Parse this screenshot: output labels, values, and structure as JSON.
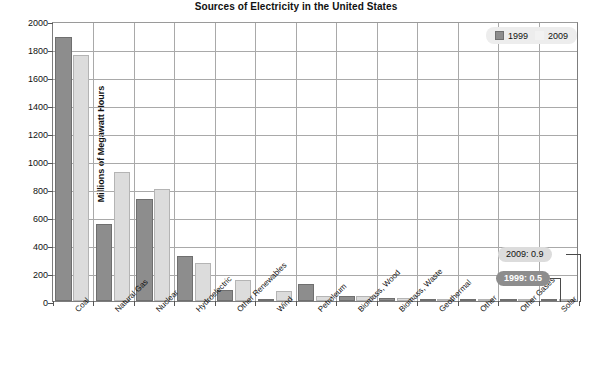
{
  "chart_data": {
    "type": "bar",
    "title": "Sources of Electricity in the United States",
    "xlabel": "",
    "ylabel": "Millions of Megawatt Hours",
    "ylim": [
      0,
      2000
    ],
    "ytick_step": 200,
    "yticks": [
      "2000",
      "1800",
      "1600",
      "1400",
      "1200",
      "1000",
      "800",
      "600",
      "400",
      "200",
      "0"
    ],
    "grid": true,
    "legend_position": "top-right",
    "categories": [
      "Coal",
      "Natural Gas",
      "Nuclear",
      "Hydroelectric",
      "Other Renewables",
      "Wind",
      "Petroleum",
      "Biomass, Wood",
      "Biomass, Waste",
      "Geothermal",
      "Other",
      "Other Gases",
      "Solar"
    ],
    "series": [
      {
        "name": "1999",
        "color": "#8d8d8d",
        "values": [
          1884,
          551,
          728,
          319,
          80,
          4.5,
          123,
          37,
          22,
          14,
          0,
          9,
          0.5
        ]
      },
      {
        "name": "2009",
        "color": "#dcdcdc",
        "values": [
          1756,
          921,
          799,
          273,
          150,
          74,
          39,
          36,
          18,
          15,
          0,
          11,
          0.9
        ]
      }
    ],
    "annotations": [
      {
        "label": "2009: 0.9",
        "series": "2009",
        "category": "Solar",
        "value": 0.9,
        "style": "light"
      },
      {
        "label": "1999: 0.5",
        "series": "1999",
        "category": "Solar",
        "value": 0.5,
        "style": "dark"
      }
    ]
  },
  "legend": {
    "items": [
      {
        "label": "1999",
        "swatch": "swatch-1999"
      },
      {
        "label": "2009",
        "swatch": "swatch-2009"
      }
    ]
  }
}
